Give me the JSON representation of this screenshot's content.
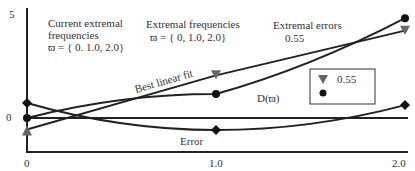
{
  "chart_data": {
    "type": "line",
    "title": "",
    "xlabel": "",
    "ylabel": "",
    "xlim": [
      0,
      2.0
    ],
    "ylim": [
      -1.6,
      5
    ],
    "grid": false,
    "x": [
      0,
      1.0,
      2.0
    ],
    "x_tick_labels": [
      "0",
      "1.0",
      "2.0"
    ],
    "y_tick_labels": [
      {
        "value": 5,
        "label": "5"
      },
      {
        "value": 0,
        "label": "0"
      }
    ],
    "series": [
      {
        "name": "Best linear fit",
        "marker": "triangle-down",
        "values": [
          -0.55,
          2.05,
          4.2
        ]
      },
      {
        "name": "D(ϖ)",
        "marker": "circle",
        "values": [
          0,
          1.15,
          4.8
        ]
      },
      {
        "name": "Error",
        "marker": "diamond",
        "values": [
          0.72,
          -0.58,
          0.62
        ]
      }
    ],
    "annotations": {
      "current_title_1": "Current extremal",
      "current_title_2": "frequencies",
      "current_set": "ϖ = { 0. 1.0, 2.0}",
      "extremal_title": "Extremal frequencies",
      "extremal_set": "ϖ = { 0, 1.0, 2.0}",
      "errors_title": "Extremal errors",
      "errors_value": "0.55",
      "best_fit_label": "Best linear fit",
      "d_label": "D(ϖ)",
      "error_label": "Error"
    },
    "legend": {
      "placement": "center-right",
      "entries": [
        {
          "marker": "triangle-down",
          "label": "0.55"
        },
        {
          "marker": "circle",
          "label": ""
        }
      ]
    }
  }
}
